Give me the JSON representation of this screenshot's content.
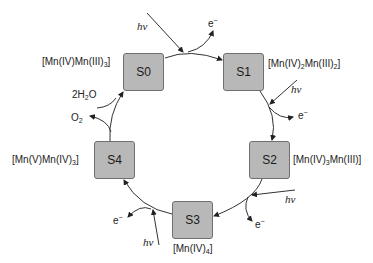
{
  "diagram": {
    "title": "",
    "states": [
      {
        "id": "S0",
        "label": "S0",
        "oxidation": {
          "pre": "[Mn(IV)Mn(III)",
          "sub": "3",
          "post": "]"
        }
      },
      {
        "id": "S1",
        "label": "S1",
        "oxidation": {
          "pre": "[Mn(IV)",
          "sub1": "2",
          "mid": "Mn(III)",
          "sub2": "2",
          "post": "]"
        }
      },
      {
        "id": "S2",
        "label": "S2",
        "oxidation": {
          "pre": "[Mn(IV)",
          "sub1": "3",
          "mid": "Mn(III)]"
        }
      },
      {
        "id": "S3",
        "label": "S3",
        "oxidation": {
          "pre": "[Mn(IV)",
          "sub": "4",
          "post": "]"
        }
      },
      {
        "id": "S4",
        "label": "S4",
        "oxidation": {
          "pre": "[Mn(V)Mn(IV)",
          "sub": "3",
          "post": "]"
        }
      }
    ],
    "photon_label": "hν",
    "electron_label": {
      "base": "e",
      "sup": "−"
    },
    "water_label": {
      "pre": "2H",
      "sub": "2",
      "post": "O"
    },
    "oxygen_label": {
      "pre": "O",
      "sub": "2"
    },
    "transitions": [
      {
        "from": "S0",
        "to": "S1",
        "input": "hν",
        "output": "e−"
      },
      {
        "from": "S1",
        "to": "S2",
        "input": "hν",
        "output": "e−"
      },
      {
        "from": "S2",
        "to": "S3",
        "input": "hν",
        "output": "e−"
      },
      {
        "from": "S3",
        "to": "S4",
        "input": "hν",
        "output": "e−"
      },
      {
        "from": "S4",
        "to": "S0",
        "input": "2H2O",
        "output": "O2"
      }
    ]
  }
}
